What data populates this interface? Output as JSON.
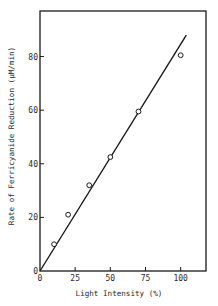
{
  "chart_data": {
    "type": "scatter",
    "title": "",
    "xlabel": "Light Intensity (%)",
    "ylabel": "Rate of Ferricyanide Reduction (μM/min)",
    "xlim": [
      0,
      118
    ],
    "ylim": [
      0,
      97
    ],
    "grid": false,
    "legend": null,
    "x_ticks": [
      0,
      25,
      50,
      75,
      100
    ],
    "y_ticks": [
      0,
      20,
      40,
      60,
      80
    ],
    "series": [
      {
        "name": "Measured",
        "marker": "open-circle",
        "x": [
          10,
          20,
          35,
          50,
          70,
          100
        ],
        "y": [
          10,
          21,
          32,
          42.5,
          59.5,
          80.5
        ]
      },
      {
        "name": "Linear fit",
        "style": "line",
        "x": [
          0,
          104
        ],
        "y": [
          0,
          88
        ]
      }
    ]
  },
  "colors": {
    "ink": "#1a1a1a",
    "background": "#ffffff"
  }
}
